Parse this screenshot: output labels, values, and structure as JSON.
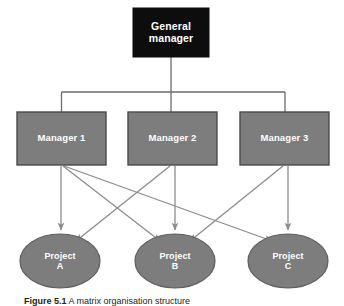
{
  "figure": {
    "caption_label": "Figure 5.1",
    "caption_text": " A matrix organisation structure",
    "background_color": "#ffffff"
  },
  "colors": {
    "root_fill": "#0d0d0d",
    "node_fill": "#7d7d7d",
    "node_stroke": "#4a4a4a",
    "connector": "#6b6b6b",
    "arrow": "#8c8c8c",
    "label_text": "#ffffff"
  },
  "nodes": {
    "root": {
      "id": "general-manager",
      "line1": "General",
      "line2": "manager",
      "shape": "rect",
      "x": 133,
      "y": 8,
      "w": 76,
      "h": 49
    },
    "managers": [
      {
        "id": "manager-1",
        "label": "Manager 1",
        "shape": "rect",
        "x": 17,
        "y": 112,
        "w": 89,
        "h": 53
      },
      {
        "id": "manager-2",
        "label": "Manager 2",
        "shape": "rect",
        "x": 128,
        "y": 112,
        "w": 89,
        "h": 53
      },
      {
        "id": "manager-3",
        "label": "Manager 3",
        "shape": "rect",
        "x": 240,
        "y": 112,
        "w": 89,
        "h": 53
      }
    ],
    "projects": [
      {
        "id": "project-a",
        "line1": "Project",
        "line2": "A",
        "shape": "ellipse",
        "cx": 60,
        "cy": 261,
        "rx": 40,
        "ry": 27
      },
      {
        "id": "project-b",
        "line1": "Project",
        "line2": "B",
        "shape": "ellipse",
        "cx": 175,
        "cy": 261,
        "rx": 40,
        "ry": 27
      },
      {
        "id": "project-c",
        "line1": "Project",
        "line2": "C",
        "shape": "ellipse",
        "cx": 288,
        "cy": 261,
        "rx": 40,
        "ry": 27
      }
    ]
  },
  "connections": {
    "hierarchy": [
      {
        "from": "general-manager",
        "to": "manager-1",
        "style": "orthogonal"
      },
      {
        "from": "general-manager",
        "to": "manager-2",
        "style": "orthogonal"
      },
      {
        "from": "general-manager",
        "to": "manager-3",
        "style": "orthogonal"
      }
    ],
    "assignments": [
      {
        "from": "manager-1",
        "to": "project-a",
        "style": "arrow"
      },
      {
        "from": "manager-1",
        "to": "project-b",
        "style": "arrow"
      },
      {
        "from": "manager-1",
        "to": "project-c",
        "style": "arrow"
      },
      {
        "from": "manager-2",
        "to": "project-a",
        "style": "arrow"
      },
      {
        "from": "manager-2",
        "to": "project-b",
        "style": "arrow"
      },
      {
        "from": "manager-3",
        "to": "project-b",
        "style": "arrow"
      },
      {
        "from": "manager-3",
        "to": "project-c",
        "style": "arrow"
      }
    ]
  }
}
